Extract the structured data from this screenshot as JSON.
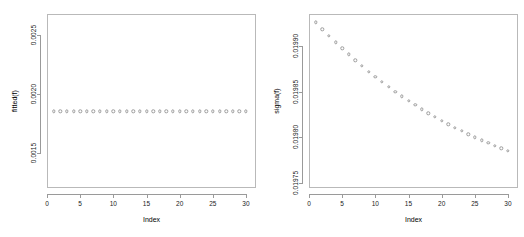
{
  "figure": {
    "background": "#ffffff",
    "point_color": "#9c9c9c",
    "axis_color": "#9a9a9a",
    "frame_color": "#b9b9b9"
  },
  "chart_data": [
    {
      "type": "scatter",
      "panel": "left",
      "title": "",
      "xlabel": "Index",
      "ylabel": "fitted(f)",
      "xlim": [
        0.0,
        31.5
      ],
      "ylim": [
        0.0012,
        0.00268
      ],
      "xticks": [
        0,
        5,
        10,
        15,
        20,
        25,
        30
      ],
      "xticklabels": [
        "0",
        "5",
        "10",
        "15",
        "20",
        "25",
        "30"
      ],
      "yticks": [
        0.0015,
        0.002,
        0.0025
      ],
      "yticklabels": [
        "0.0015",
        "0.0020",
        "0.0025"
      ],
      "grid": false,
      "legend": "none",
      "marker": "open-circle",
      "x": [
        1,
        2,
        3,
        4,
        5,
        6,
        7,
        8,
        9,
        10,
        11,
        12,
        13,
        14,
        15,
        16,
        17,
        18,
        19,
        20,
        21,
        22,
        23,
        24,
        25,
        26,
        27,
        28,
        29,
        30
      ],
      "y": [
        0.001853,
        0.001853,
        0.001853,
        0.001853,
        0.001853,
        0.001853,
        0.001853,
        0.001853,
        0.001853,
        0.001853,
        0.001853,
        0.001853,
        0.001853,
        0.001853,
        0.001853,
        0.001853,
        0.001853,
        0.001853,
        0.001853,
        0.001853,
        0.001853,
        0.001853,
        0.001853,
        0.001853,
        0.001853,
        0.001853,
        0.001853,
        0.001853,
        0.001853,
        0.001853
      ]
    },
    {
      "type": "scatter",
      "panel": "right",
      "title": "",
      "xlabel": "Index",
      "ylabel": "sigma(f)",
      "xlim": [
        0.0,
        31.5
      ],
      "ylim": [
        0.019745,
        0.0199345
      ],
      "xticks": [
        0,
        5,
        10,
        15,
        20,
        25,
        30
      ],
      "xticklabels": [
        "0",
        "5",
        "10",
        "15",
        "20",
        "25",
        "30"
      ],
      "yticks": [
        0.01975,
        0.0198,
        0.01985,
        0.0199
      ],
      "yticklabels": [
        "0.01975",
        "0.01980",
        "0.01985",
        "0.01990"
      ],
      "grid": false,
      "legend": "none",
      "marker": "open-circle",
      "x": [
        1,
        2,
        3,
        4,
        5,
        6,
        7,
        8,
        9,
        10,
        11,
        12,
        13,
        14,
        15,
        16,
        17,
        18,
        19,
        20,
        21,
        22,
        23,
        24,
        25,
        26,
        27,
        28,
        29,
        30
      ],
      "y": [
        0.0199255,
        0.019918,
        0.0199108,
        0.0199038,
        0.019897,
        0.0198904,
        0.019884,
        0.0198778,
        0.0198718,
        0.019866,
        0.0198604,
        0.019855,
        0.0198498,
        0.0198448,
        0.01984,
        0.0198353,
        0.0198308,
        0.0198265,
        0.0198223,
        0.0198183,
        0.0198144,
        0.0198107,
        0.0198071,
        0.0198036,
        0.0198003,
        0.0197971,
        0.019794,
        0.0197911,
        0.0197883,
        0.0197856
      ]
    }
  ]
}
